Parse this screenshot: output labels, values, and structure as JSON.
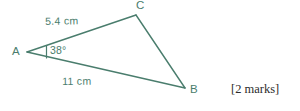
{
  "figure": {
    "type": "triangle-diagram",
    "stroke_color": "#4a7d6d",
    "label_color": "#4a7d6d",
    "background_color": "#ffffff",
    "vertices": [
      {
        "name": "A",
        "label": "A",
        "x": 27,
        "y": 52
      },
      {
        "name": "B",
        "label": "B",
        "x": 185,
        "y": 88
      },
      {
        "name": "C",
        "label": "C",
        "x": 136,
        "y": 15
      }
    ],
    "sides": [
      {
        "name": "AC",
        "label": "5.4 cm",
        "length": 5.4,
        "unit": "cm"
      },
      {
        "name": "AB",
        "label": "11 cm",
        "length": 11,
        "unit": "cm"
      },
      {
        "name": "CB",
        "label": "",
        "length": null,
        "unit": ""
      }
    ],
    "angles": [
      {
        "at": "A",
        "label": "38°",
        "value": 38,
        "unit": "degrees",
        "marker": "tick"
      }
    ]
  },
  "question": {
    "marks_note": "[2 marks]",
    "marks": 2
  }
}
